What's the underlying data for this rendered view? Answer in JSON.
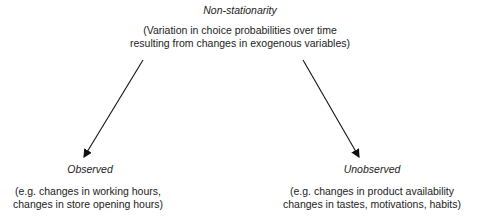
{
  "root": {
    "title": "Non-stationarity",
    "desc_line1": "(Variation in choice probabilities over time",
    "desc_line2": "resulting from changes in exogenous variables)"
  },
  "left": {
    "title": "Observed",
    "desc_line1": "(e.g. changes in working hours,",
    "desc_line2": "changes in store opening hours)"
  },
  "right": {
    "title": "Unobserved",
    "desc_line1": "(e.g. changes in product availability",
    "desc_line2": "changes in tastes, motivations, habits)"
  },
  "colors": {
    "text": "#222222",
    "arrow": "#111111"
  }
}
